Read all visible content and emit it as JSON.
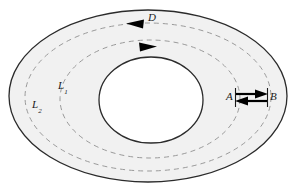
{
  "figure": {
    "name": "annulus-contour-diagram",
    "canvas": {
      "width": 299,
      "height": 191
    },
    "colors": {
      "background": "#ffffff",
      "region_fill": "#f1f1f1",
      "boundary_stroke": "#2b2b2b",
      "dashed_stroke": "#9a9a9a",
      "arrow_fill": "#000000",
      "label_color": "#1a1a1a"
    },
    "labels": [
      {
        "id": "L1",
        "base": "L",
        "sub": "1",
        "x": 58,
        "y": 80
      },
      {
        "id": "L2",
        "base": "L",
        "sub": "2",
        "x": 32,
        "y": 99
      },
      {
        "id": "D",
        "base": "D",
        "sub": "",
        "x": 148,
        "y": 12
      },
      {
        "id": "A",
        "base": "A",
        "sub": "",
        "x": 226,
        "y": 91
      },
      {
        "id": "B",
        "base": "B",
        "sub": "",
        "x": 270,
        "y": 91
      }
    ],
    "shapes": {
      "outer_boundary": {
        "type": "ellipse",
        "cx": 148,
        "cy": 96,
        "rx": 139,
        "ry": 86,
        "stroke": "#2b2b2b",
        "stroke_width": 1.3,
        "fill": "#f1f1f1",
        "dashed": false
      },
      "inner_boundary": {
        "type": "ellipse",
        "cx": 151,
        "cy": 100,
        "rx": 52,
        "ry": 43,
        "stroke": "#2b2b2b",
        "stroke_width": 1.3,
        "fill": "#ffffff",
        "dashed": false
      },
      "contour_L2": {
        "type": "ellipse",
        "cx": 148,
        "cy": 97,
        "rx": 123,
        "ry": 74,
        "stroke": "#9a9a9a",
        "stroke_width": 1.0,
        "fill": "none",
        "dashed": true,
        "dash_pattern": "5 4",
        "orientation": "counterclockwise"
      },
      "contour_L1": {
        "type": "ellipse",
        "cx": 150,
        "cy": 99,
        "rx": 90,
        "ry": 59,
        "stroke": "#9a9a9a",
        "stroke_width": 1.0,
        "fill": "none",
        "dashed": true,
        "dash_pattern": "5 4",
        "orientation": "clockwise"
      }
    },
    "arrows": [
      {
        "id": "arrow-D",
        "on_contour": "L2",
        "direction": "left",
        "label": "D",
        "tip_x": 127,
        "tip_y": 23,
        "length": 16
      },
      {
        "id": "arrow-inner",
        "on_contour": "L1",
        "direction": "right",
        "label": "",
        "tip_x": 155,
        "tip_y": 46,
        "length": 16
      },
      {
        "id": "arrow-A-to-B",
        "direction": "right",
        "label": "",
        "x1": 235,
        "y1": 94,
        "x2": 268,
        "y2": 94
      },
      {
        "id": "arrow-B-to-A",
        "direction": "left",
        "label": "",
        "x1": 268,
        "y1": 101,
        "x2": 235,
        "y2": 101
      }
    ],
    "cut_ticks": [
      {
        "id": "tick-A",
        "x": 235,
        "y_top": 88,
        "y_bottom": 107
      },
      {
        "id": "tick-B",
        "x": 268,
        "y_top": 88,
        "y_bottom": 107
      }
    ]
  }
}
